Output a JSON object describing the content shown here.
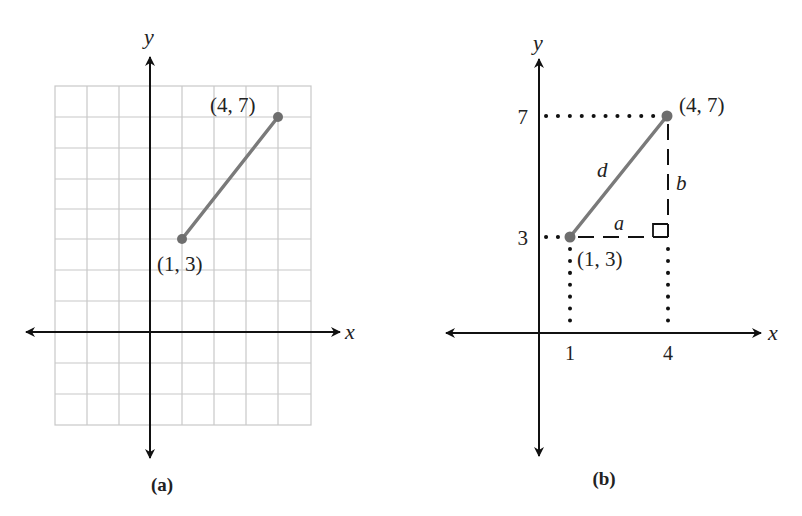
{
  "figure": {
    "panel_a": {
      "caption": "(a)",
      "x_axis_label": "x",
      "y_axis_label": "y",
      "grid": {
        "x_min": -3,
        "x_max": 5,
        "y_min": -3,
        "y_max": 8
      },
      "points": [
        {
          "label": "(1, 3)",
          "x": 1,
          "y": 3
        },
        {
          "label": "(4, 7)",
          "x": 4,
          "y": 7
        }
      ]
    },
    "panel_b": {
      "caption": "(b)",
      "x_axis_label": "x",
      "y_axis_label": "y",
      "x_ticks": [
        "1",
        "4"
      ],
      "y_ticks": [
        "3",
        "7"
      ],
      "points": [
        {
          "label": "(1, 3)",
          "x": 1,
          "y": 3
        },
        {
          "label": "(4, 7)",
          "x": 4,
          "y": 7
        }
      ],
      "segment_labels": {
        "hypotenuse": "d",
        "horizontal_leg": "a",
        "vertical_leg": "b"
      }
    }
  },
  "colors": {
    "axis": "#111111",
    "grid": "#c8c8c8",
    "segment": "#7a7a7a",
    "point": "#6e6e6e",
    "text": "#222222"
  }
}
